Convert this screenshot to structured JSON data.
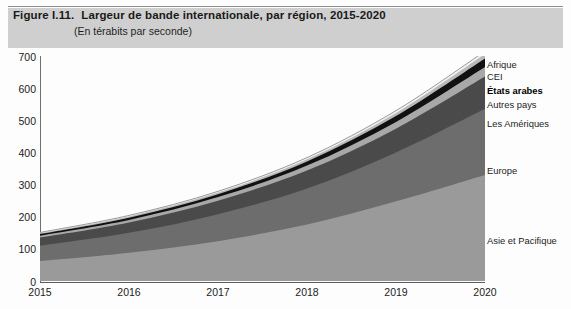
{
  "figure": {
    "number": "Figure I.11.",
    "title": "Largeur de bande internationale, par région, 2015-2020",
    "subtitle": "(En térabits par seconde)"
  },
  "chart_data": {
    "type": "area",
    "stacked": true,
    "title": "Largeur de bande internationale, par région, 2015-2020",
    "subtitle": "(En térabits par seconde)",
    "xlabel": "",
    "ylabel": "",
    "categories": [
      "2015",
      "2016",
      "2017",
      "2018",
      "2019",
      "2020"
    ],
    "x": [
      2015,
      2016,
      2017,
      2018,
      2019,
      2020
    ],
    "ylim": [
      0,
      700
    ],
    "ytick_step": 100,
    "yticks": [
      "0",
      "100",
      "200",
      "300",
      "400",
      "500",
      "600",
      "700"
    ],
    "grid": false,
    "legend_position": "right-inline",
    "series": [
      {
        "name": "Asie et Pacifique",
        "color": "#9a9a9a",
        "values": [
          62,
          88,
          124,
          176,
          248,
          330
        ]
      },
      {
        "name": "Europe",
        "color": "#6d6d6d",
        "values": [
          48,
          62,
          84,
          112,
          152,
          206
        ]
      },
      {
        "name": "Les Amériques",
        "color": "#4a4a4a",
        "values": [
          25,
          32,
          42,
          56,
          74,
          100
        ]
      },
      {
        "name": "Autres pays",
        "color": "#a8a8a8",
        "values": [
          6,
          8,
          11,
          15,
          21,
          30
        ]
      },
      {
        "name": "États arabes",
        "color": "#111111",
        "values": [
          5,
          7,
          9,
          13,
          18,
          26
        ]
      },
      {
        "name": "CEI",
        "color": "#b9b9b9",
        "values": [
          3,
          4,
          5,
          7,
          10,
          14
        ]
      },
      {
        "name": "Afrique",
        "color": "#f2f2f2",
        "values": [
          2,
          3,
          4,
          5,
          7,
          9
        ]
      }
    ],
    "totals": [
      151,
      204,
      279,
      384,
      530,
      715
    ]
  },
  "legend": {
    "labels": [
      "Afrique",
      "CEI",
      "États arabes",
      "Autres pays",
      "Les Amériques",
      "Europe",
      "Asie et Pacifique"
    ]
  },
  "colors": {
    "title_band": "#cfcfcf",
    "axis": "#5c5c5c",
    "text": "#1c1c1c"
  }
}
